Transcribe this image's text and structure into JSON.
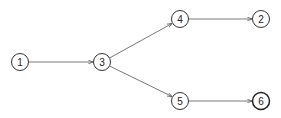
{
  "diagram": {
    "type": "directed-graph",
    "stroke_color": "#333333",
    "edge_color": "#555555",
    "background": "#ffffff",
    "nodes": [
      {
        "id": "1",
        "label": "1",
        "x": 20,
        "y": 62,
        "bold": false
      },
      {
        "id": "3",
        "label": "3",
        "x": 102,
        "y": 62,
        "bold": false
      },
      {
        "id": "4",
        "label": "4",
        "x": 180,
        "y": 19,
        "bold": false
      },
      {
        "id": "2",
        "label": "2",
        "x": 261,
        "y": 19,
        "bold": false
      },
      {
        "id": "5",
        "label": "5",
        "x": 180,
        "y": 101,
        "bold": false
      },
      {
        "id": "6",
        "label": "6",
        "x": 261,
        "y": 101,
        "bold": true
      }
    ],
    "edges": [
      {
        "from": "1",
        "to": "3"
      },
      {
        "from": "3",
        "to": "4"
      },
      {
        "from": "3",
        "to": "5"
      },
      {
        "from": "4",
        "to": "2"
      },
      {
        "from": "5",
        "to": "6"
      }
    ]
  }
}
